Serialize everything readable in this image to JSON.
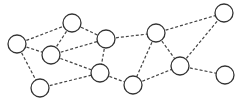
{
  "diagram": {
    "type": "network-graph",
    "node_radius": 9,
    "colors": {
      "node_stroke": "#333333",
      "node_fill": "#ffffff",
      "edge": "#444444",
      "background": "#ffffff"
    },
    "nodes": [
      {
        "id": "A",
        "x": 17,
        "y": 44
      },
      {
        "id": "B",
        "x": 72,
        "y": 23
      },
      {
        "id": "C",
        "x": 51,
        "y": 55
      },
      {
        "id": "D",
        "x": 106,
        "y": 39
      },
      {
        "id": "E",
        "x": 40,
        "y": 88
      },
      {
        "id": "F",
        "x": 100,
        "y": 73
      },
      {
        "id": "G",
        "x": 156,
        "y": 33
      },
      {
        "id": "H",
        "x": 133,
        "y": 85
      },
      {
        "id": "I",
        "x": 180,
        "y": 66
      },
      {
        "id": "J",
        "x": 224,
        "y": 13
      },
      {
        "id": "K",
        "x": 225,
        "y": 75
      }
    ],
    "edges": [
      [
        "A",
        "B"
      ],
      [
        "A",
        "C"
      ],
      [
        "A",
        "E"
      ],
      [
        "B",
        "C"
      ],
      [
        "B",
        "D"
      ],
      [
        "C",
        "D"
      ],
      [
        "C",
        "F"
      ],
      [
        "D",
        "F"
      ],
      [
        "D",
        "G"
      ],
      [
        "E",
        "F"
      ],
      [
        "F",
        "H"
      ],
      [
        "G",
        "H"
      ],
      [
        "G",
        "I"
      ],
      [
        "G",
        "J"
      ],
      [
        "H",
        "I"
      ],
      [
        "I",
        "J"
      ],
      [
        "I",
        "K"
      ]
    ]
  }
}
